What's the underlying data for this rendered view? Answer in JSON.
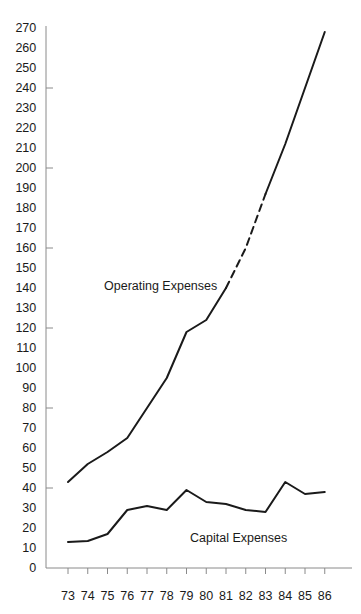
{
  "chart_data": {
    "type": "line",
    "title": "",
    "xlabel": "",
    "ylabel": "",
    "x": [
      73,
      74,
      75,
      76,
      77,
      78,
      79,
      80,
      81,
      82,
      83,
      84,
      85,
      86
    ],
    "xticklabels": [
      "73",
      "74",
      "75",
      "76",
      "77",
      "78",
      "79",
      "80",
      "81",
      "82",
      "83",
      "84",
      "85",
      "86"
    ],
    "yticklabels": [
      "270",
      "260",
      "250",
      "240",
      "230",
      "220",
      "210",
      "200",
      "190",
      "180",
      "170",
      "160",
      "150",
      "140",
      "130",
      "120",
      "110",
      "100",
      "90",
      "80",
      "70",
      "60",
      "50",
      "40",
      "30",
      "20",
      "10",
      "0"
    ],
    "ylim": [
      0,
      270
    ],
    "ytick_step": 10,
    "grid": false,
    "legend": "inline-annotations",
    "series": [
      {
        "name": "Operating Expenses",
        "values": [
          43,
          52,
          58,
          65,
          80,
          95,
          118,
          124,
          140,
          160,
          187,
          212,
          240,
          268
        ],
        "style": "solid-with-dashed-gap",
        "dashed_from": 81,
        "dashed_to": 83,
        "color": "#1a1a1a"
      },
      {
        "name": "Capital Expenses",
        "values": [
          13,
          13.5,
          17,
          29,
          31,
          29,
          39,
          33,
          32,
          29,
          28,
          43,
          37,
          38
        ],
        "style": "solid",
        "color": "#1a1a1a"
      }
    ],
    "annotations": [
      {
        "text": "Operating Expenses",
        "x_px": 104,
        "y_px": 279
      },
      {
        "text": "Capital Expenses",
        "x_px": 190,
        "y_px": 531
      }
    ]
  },
  "axis": {
    "major_ticks_y": [
      "240",
      "200",
      "160",
      "120",
      "80",
      "40"
    ],
    "axis_color": "#8a8a8a"
  }
}
